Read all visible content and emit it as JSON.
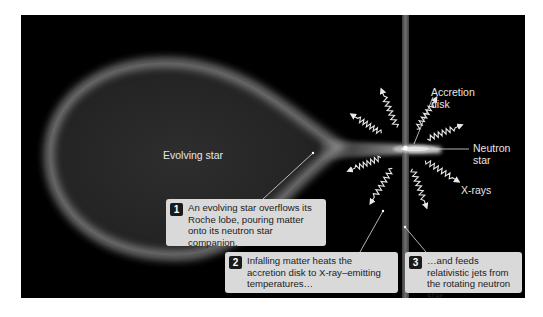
{
  "diagram": {
    "labels": {
      "evolving_star": "Evolving star",
      "accretion_disk": "Accretion\ndisk",
      "neutron_star": "Neutron\nstar",
      "xrays": "X-rays"
    },
    "callouts": [
      {
        "number": "1",
        "text": "An evolving star overflows its Roche lobe, pouring matter onto its neutron star companion."
      },
      {
        "number": "2",
        "text": "Infalling matter heats the accretion disk to X-ray–emitting temperatures…"
      },
      {
        "number": "3",
        "text": "…and feeds relativistic jets from the rotating neutron star."
      }
    ],
    "colors": {
      "background": "#000000",
      "callout_fill": "#d9d9d9",
      "label_text": "#e6e6e6"
    }
  }
}
